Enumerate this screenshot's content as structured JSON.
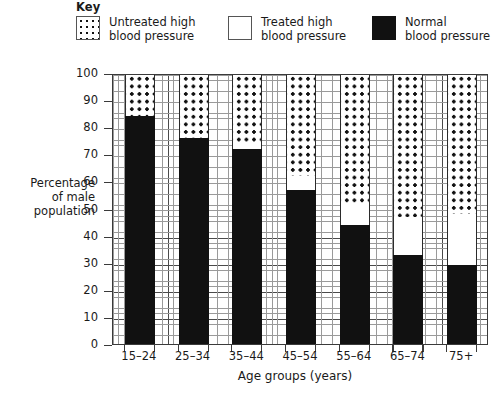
{
  "key": {
    "title": "Key",
    "items": [
      {
        "swatch": "dotted-swatch-icon",
        "label": "Untreated high\nblood pressure"
      },
      {
        "swatch": "white-swatch-icon",
        "label": "Treated high\nblood pressure"
      },
      {
        "swatch": "black-swatch-icon",
        "label": "Normal\nblood pressure"
      }
    ]
  },
  "chart_data": {
    "type": "bar",
    "subtype": "stacked",
    "title": "",
    "xlabel": "Age groups (years)",
    "ylabel": "Percentage\nof male\npopulation",
    "categories": [
      "15–24",
      "25–34",
      "35–44",
      "45–54",
      "55–64",
      "65–74",
      "75+"
    ],
    "series": [
      {
        "name": "Normal blood pressure",
        "fill": "black",
        "values": [
          84,
          76,
          72,
          57,
          44,
          33,
          29
        ]
      },
      {
        "name": "Treated high blood pressure",
        "fill": "white",
        "values": [
          0,
          0,
          2,
          5,
          8,
          14,
          19
        ]
      },
      {
        "name": "Untreated high blood pressure",
        "fill": "dotted",
        "values": [
          16,
          24,
          26,
          38,
          48,
          53,
          52
        ]
      }
    ],
    "ylim": [
      0,
      100
    ],
    "ytick_labels": [
      "0",
      "10",
      "20",
      "30",
      "40",
      "50",
      "60",
      "70",
      "80",
      "90",
      "100"
    ],
    "ytick_values": [
      0,
      10,
      20,
      30,
      40,
      50,
      60,
      70,
      80,
      90,
      100
    ],
    "grid": true,
    "grid_minor": true,
    "legend_position": "above-plot"
  }
}
